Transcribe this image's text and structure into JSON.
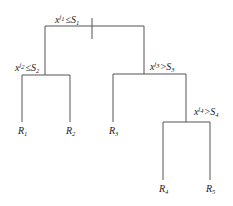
{
  "diagram": {
    "type": "decision-tree",
    "splits": [
      {
        "id": "split-1",
        "var": "x",
        "var_sup": "j",
        "var_sup_sub": "1",
        "op": "≤",
        "thr": "S",
        "thr_sub": "1"
      },
      {
        "id": "split-2",
        "var": "x",
        "var_sup": "j",
        "var_sup_sub": "2",
        "op": "≤",
        "thr": "S",
        "thr_sub": "2"
      },
      {
        "id": "split-3",
        "var": "x",
        "var_sup": "j",
        "var_sup_sub": "3",
        "op": ">",
        "thr": "S",
        "thr_sub": "3"
      },
      {
        "id": "split-4",
        "var": "x",
        "var_sup": "j",
        "var_sup_sub": "4",
        "op": ">",
        "thr": "S",
        "thr_sub": "4"
      }
    ],
    "leaves": [
      {
        "id": "R1",
        "name": "R",
        "sub": "1"
      },
      {
        "id": "R2",
        "name": "R",
        "sub": "2"
      },
      {
        "id": "R3",
        "name": "R",
        "sub": "3"
      },
      {
        "id": "R4",
        "name": "R",
        "sub": "4"
      },
      {
        "id": "R5",
        "name": "R",
        "sub": "5"
      }
    ],
    "line_color": "#555555"
  }
}
